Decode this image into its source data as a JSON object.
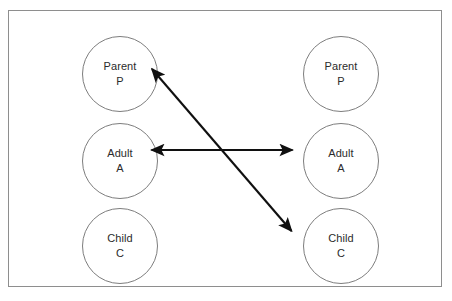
{
  "diagram": {
    "frame": {
      "border_color": "#8e8e8e",
      "background_color": "#ffffff"
    },
    "circle_style": {
      "stroke_color": "#7d7d7d",
      "text_color": "#2b2b2b"
    },
    "arrow_style": {
      "color": "#101010"
    },
    "persons": [
      {
        "id": "left",
        "label": "Person 1",
        "ego_states": [
          {
            "id": "parent",
            "name": "Parent",
            "code": "P"
          },
          {
            "id": "adult",
            "name": "Adult",
            "code": "A"
          },
          {
            "id": "child",
            "name": "Child",
            "code": "C"
          }
        ]
      },
      {
        "id": "right",
        "label": "Person 2",
        "ego_states": [
          {
            "id": "parent",
            "name": "Parent",
            "code": "P"
          },
          {
            "id": "adult",
            "name": "Adult",
            "code": "A"
          },
          {
            "id": "child",
            "name": "Child",
            "code": "C"
          }
        ]
      }
    ],
    "transactions": [
      {
        "id": "adult-adult",
        "kind": "double-headed-arrow",
        "orientation": "horizontal",
        "from": "left-adult",
        "to": "right-adult",
        "label": ""
      },
      {
        "id": "parent-child",
        "kind": "double-headed-arrow",
        "orientation": "diagonal",
        "from": "left-parent",
        "to": "right-child",
        "label": ""
      }
    ]
  }
}
